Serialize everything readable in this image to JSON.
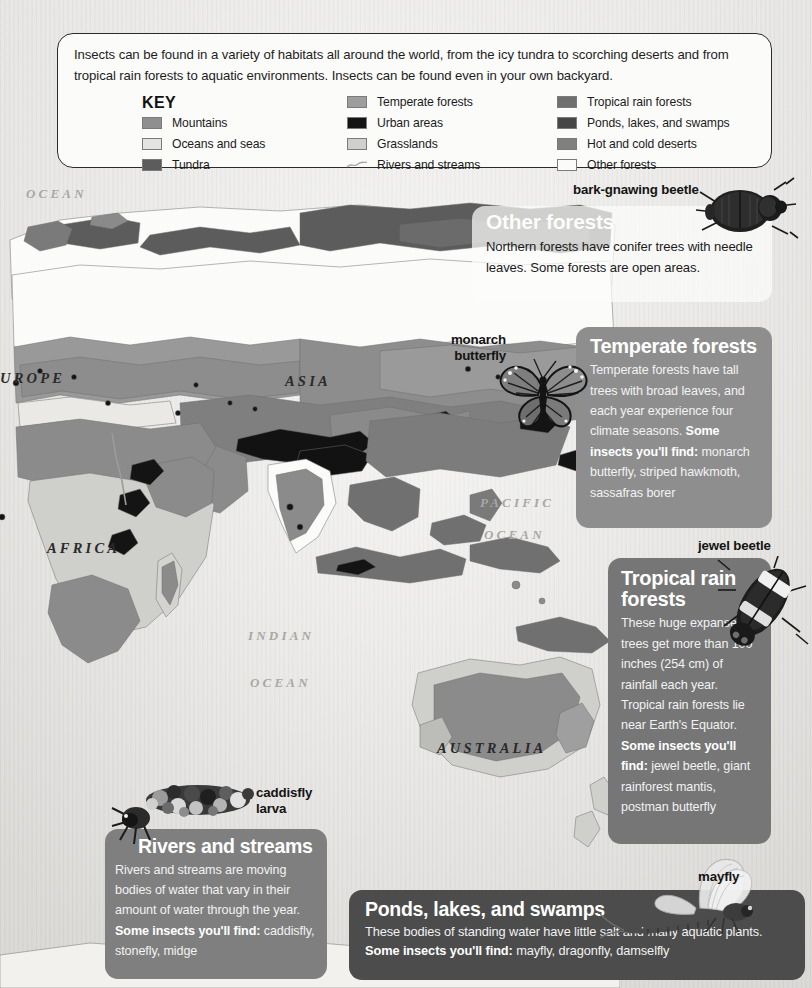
{
  "intro": {
    "text": "Insects can be found in a variety of habitats all around the world, from the icy tundra to scorching deserts and from tropical rain forests to aquatic environments. Insects can be found even in your own backyard."
  },
  "key": {
    "title": "KEY",
    "columns": [
      [
        {
          "label": "Mountains",
          "swatch": "#8f8f8f",
          "icon": "color-swatch"
        },
        {
          "label": "Oceans and seas",
          "swatch": "#e4e3e0",
          "icon": "color-swatch"
        },
        {
          "label": "Tundra",
          "swatch": "#5c5c5c",
          "icon": "color-swatch"
        }
      ],
      [
        {
          "label": "Temperate forests",
          "swatch": "#9d9d9d",
          "icon": "color-swatch"
        },
        {
          "label": "Urban areas",
          "swatch": "#141414",
          "icon": "color-swatch"
        },
        {
          "label": "Grasslands",
          "swatch": "#cfcfcc",
          "icon": "color-swatch"
        },
        {
          "label": "Rivers and streams",
          "swatch": "line",
          "icon": "river-line-icon"
        }
      ],
      [
        {
          "label": "Tropical rain forests",
          "swatch": "#6f6f6f",
          "icon": "color-swatch"
        },
        {
          "label": "Ponds, lakes, and swamps",
          "swatch": "#464646",
          "icon": "color-swatch"
        },
        {
          "label": "Hot and cold deserts",
          "swatch": "#7f7f7f",
          "icon": "color-swatch"
        },
        {
          "label": "Other forests",
          "swatch": "#fbfbfa",
          "icon": "color-swatch"
        }
      ]
    ]
  },
  "map": {
    "labels": [
      {
        "name": "ocean-label-arctic",
        "text": "OCEAN",
        "kind": "ocean"
      },
      {
        "name": "continent-europe",
        "text": "UROPE",
        "kind": "continent"
      },
      {
        "name": "continent-asia",
        "text": "ASIA",
        "kind": "continent"
      },
      {
        "name": "continent-africa",
        "text": "AFRICA",
        "kind": "continent"
      },
      {
        "name": "ocean-label-pacific",
        "text": "PACIFIC",
        "kind": "ocean"
      },
      {
        "name": "ocean-label-pacific2",
        "text": "OCEAN",
        "kind": "ocean"
      },
      {
        "name": "ocean-label-indian",
        "text": "INDIAN",
        "kind": "ocean"
      },
      {
        "name": "ocean-label-indian2",
        "text": "OCEAN",
        "kind": "ocean"
      },
      {
        "name": "continent-australia",
        "text": "AUSTRALIA",
        "kind": "continent"
      }
    ]
  },
  "panels": {
    "other_forests": {
      "title": "Other forests",
      "body": "Northern forests have conifer trees with needle leaves. Some forests are open areas."
    },
    "temperate": {
      "title": "Temperate forests",
      "body_part1": "Temperate forests have tall trees with broad leaves, and each year experience four climate seasons. ",
      "body_bold": "Some insects you'll find:",
      "body_part2": " monarch butterfly, striped hawkmoth, sassafras borer"
    },
    "tropical": {
      "title": "Tropical rain forests",
      "body_part1": "These huge expanses of trees get more than 100 inches (254 cm) of rainfall each year. Tropical rain forests lie near Earth's Equator. ",
      "body_bold": "Some insects you'll find:",
      "body_part2": " jewel beetle, giant rainforest mantis, postman butterfly"
    },
    "rivers": {
      "title": "Rivers and streams",
      "body_part1": "Rivers and streams are moving bodies of water that vary in their amount of water through the year. ",
      "body_bold": "Some insects you'll find:",
      "body_part2": " caddisfly, stonefly, midge"
    },
    "ponds": {
      "title": "Ponds, lakes, and swamps",
      "body_part1": "These bodies of standing water have little salt and many aquatic plants. ",
      "body_bold": "Some insects you'll find:",
      "body_part2": " mayfly, dragonfly, damselfly"
    }
  },
  "insects": {
    "bark_gnawing_beetle": "bark-gnawing beetle",
    "monarch_butterfly": "monarch\nbutterfly",
    "jewel_beetle": "jewel beetle",
    "caddisfly_larva": "caddisfly\nlarva",
    "mayfly": "mayfly"
  },
  "colors": {
    "panel_temperate": "#8e8e8e",
    "panel_tropical": "#767676",
    "panel_rivers": "#7f7f7f",
    "panel_ponds": "#4c4c4c",
    "panel_other_forests": "#fcfcfb",
    "page_background": "#ecebe8",
    "card_border": "#2b2b2b"
  }
}
